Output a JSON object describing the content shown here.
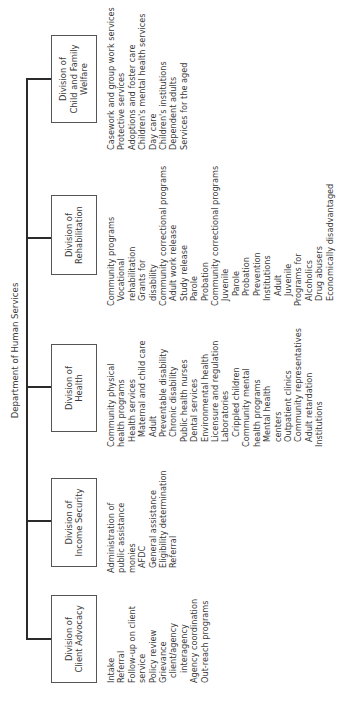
{
  "title": "Department of Human Services",
  "divisions": [
    {
      "name": "Division of Client Advocacy",
      "label_lines": [
        "Division of",
        "Client Advocacy"
      ],
      "items": [
        {
          "text": "Intake",
          "indent": 0
        },
        {
          "text": "Referral",
          "indent": 0
        },
        {
          "text": "Follow-up on client",
          "indent": 0
        },
        {
          "text": "service",
          "indent": 0
        },
        {
          "text": "Policy review",
          "indent": 0
        },
        {
          "text": "Grievance",
          "indent": 0
        },
        {
          "text": "client/agency",
          "indent": 1
        },
        {
          "text": "interagency",
          "indent": 2
        },
        {
          "text": "Agency coordination",
          "indent": 0
        },
        {
          "text": "Out-reach programs",
          "indent": 0
        }
      ]
    },
    {
      "name": "Division of Income Security",
      "label_lines": [
        "Division of",
        "Income Security"
      ],
      "items": [
        {
          "text": "Administration of",
          "indent": 0
        },
        {
          "text": "public assistance",
          "indent": 0
        },
        {
          "text": "monies",
          "indent": 0
        },
        {
          "text": "AFDC",
          "indent": 1
        },
        {
          "text": "General assistance",
          "indent": 1
        },
        {
          "text": "Eligibility determination",
          "indent": 1
        },
        {
          "text": "Referral",
          "indent": 1
        }
      ]
    },
    {
      "name": "Division of Health",
      "label_lines": [
        "Division of",
        "Health"
      ],
      "items": [
        {
          "text": "Community physical",
          "indent": 0
        },
        {
          "text": "health programs",
          "indent": 0
        },
        {
          "text": "Health services",
          "indent": 1
        },
        {
          "text": "Maternal and child care",
          "indent": 2
        },
        {
          "text": "Adult",
          "indent": 2
        },
        {
          "text": "Preventable disability",
          "indent": 2
        },
        {
          "text": "Chronic disability",
          "indent": 2
        },
        {
          "text": "Public health nurses",
          "indent": 1
        },
        {
          "text": "Dental services",
          "indent": 1
        },
        {
          "text": "Environmental health",
          "indent": 1
        },
        {
          "text": "Licensure and regulation",
          "indent": 1
        },
        {
          "text": "Laboratories",
          "indent": 1
        },
        {
          "text": "Crippled children",
          "indent": 2
        },
        {
          "text": "Community mental",
          "indent": 0
        },
        {
          "text": "health programs",
          "indent": 0
        },
        {
          "text": "Mental health",
          "indent": 1
        },
        {
          "text": "centers",
          "indent": 1
        },
        {
          "text": "Outpatient clinics",
          "indent": 1
        },
        {
          "text": "Community representatives",
          "indent": 1
        },
        {
          "text": "Adult retardation",
          "indent": 1
        },
        {
          "text": "Institutions",
          "indent": 0
        }
      ]
    },
    {
      "name": "Division of Rehabilitation",
      "label_lines": [
        "Division of",
        "Rehabilitation"
      ],
      "items": [
        {
          "text": "Community programs",
          "indent": 0
        },
        {
          "text": "Vocational",
          "indent": 1
        },
        {
          "text": "rehabilitation",
          "indent": 1
        },
        {
          "text": "Grants for",
          "indent": 1
        },
        {
          "text": "disability",
          "indent": 1
        },
        {
          "text": "Community correctional programs",
          "indent": 0
        },
        {
          "text": "Adult work release",
          "indent": 1
        },
        {
          "text": "Study release",
          "indent": 1
        },
        {
          "text": "Parole",
          "indent": 1
        },
        {
          "text": "Probation",
          "indent": 1
        },
        {
          "text": "Community correctional programs",
          "indent": 0
        },
        {
          "text": "Juvenile",
          "indent": 1
        },
        {
          "text": "Parole",
          "indent": 2
        },
        {
          "text": "Probation",
          "indent": 2
        },
        {
          "text": "Prevention",
          "indent": 2
        },
        {
          "text": "Institutions",
          "indent": 1
        },
        {
          "text": "Adult",
          "indent": 2
        },
        {
          "text": "Juvenile",
          "indent": 2
        },
        {
          "text": "Programs for",
          "indent": 0
        },
        {
          "text": "Alcoholics",
          "indent": 1
        },
        {
          "text": "Drug abusers",
          "indent": 1
        },
        {
          "text": "Economically disadvantaged",
          "indent": 1
        }
      ]
    },
    {
      "name": "Division of Child and Family Welfare",
      "label_lines": [
        "Division of",
        "Child and Family",
        "Welfare"
      ],
      "items": [
        {
          "text": "Casework and group work services",
          "indent": 0
        },
        {
          "text": "Protective services",
          "indent": 0
        },
        {
          "text": "Adoptions and foster care",
          "indent": 0
        },
        {
          "text": "Children's mental health services",
          "indent": 0
        },
        {
          "text": "Day care",
          "indent": 0
        },
        {
          "text": "Children's institutions",
          "indent": 0
        },
        {
          "text": "Dependent adults",
          "indent": 0
        },
        {
          "text": "Services for the aged",
          "indent": 0
        }
      ]
    }
  ]
}
